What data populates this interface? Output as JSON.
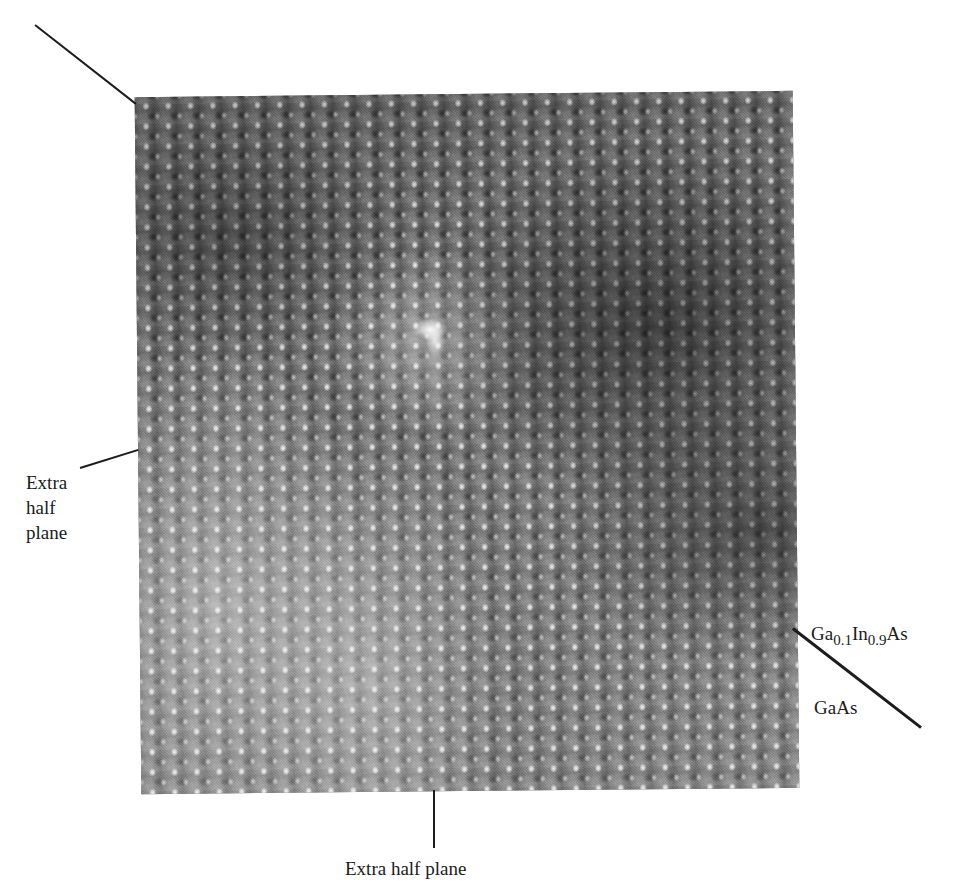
{
  "figure": {
    "type": "hrtem-micrograph",
    "background_color": "#ffffff",
    "ink_color": "#1b1b1b"
  },
  "micrograph": {
    "name": "lattice-image",
    "x": 138,
    "y": 94,
    "width": 658,
    "height": 697,
    "rotation_deg": -0.55,
    "base_gray": "#6e6e6e",
    "column_spacing_px": 22.3,
    "row_spacing_px": 20.2,
    "defect": {
      "name": "dislocation-core",
      "x": 268,
      "y": 216,
      "width": 54,
      "height": 46
    }
  },
  "annotations": {
    "extra_half_plane_top": {
      "label": "",
      "leader": {
        "x1": 35,
        "y1": 25,
        "x2": 136,
        "y2": 104
      }
    },
    "extra_half_plane_left": {
      "label_lines": [
        "Extra",
        "half",
        "plane"
      ],
      "line1": "Extra",
      "line2": "half",
      "line3": "plane",
      "leader": {
        "x1": 80,
        "y1": 468,
        "x2": 138,
        "y2": 450
      }
    },
    "extra_half_plane_bottom": {
      "label": "Extra half plane",
      "leader": {
        "x1": 434,
        "y1": 790,
        "x2": 434,
        "y2": 848
      }
    },
    "interface": {
      "upper_layer": {
        "formula_parts": [
          "Ga",
          "0.1",
          "In",
          "0.9",
          "As"
        ],
        "el1": "Ga",
        "sub1": "0.1",
        "el2": "In",
        "sub2": "0.9",
        "el3": "As"
      },
      "lower_layer": {
        "formula": "GaAs"
      },
      "leader": {
        "x1": 793,
        "y1": 628,
        "x2": 921,
        "y2": 727
      }
    }
  }
}
